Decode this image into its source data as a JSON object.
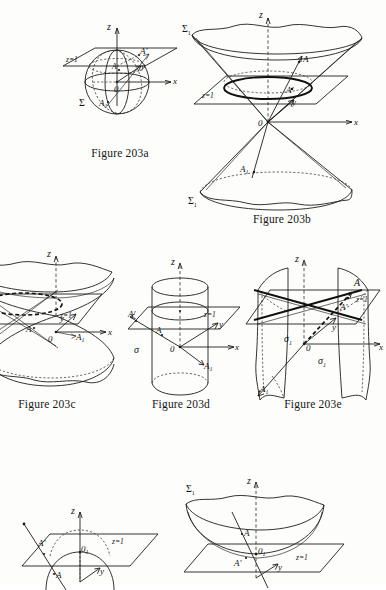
{
  "page": {
    "background_color": "#fdfdfc",
    "ink_color": "#1d1d1a",
    "width": 386,
    "height": 584
  },
  "figures": [
    {
      "id": "203a",
      "caption": "Figure 203a",
      "surface": "sphere",
      "labels": {
        "z_axis": "z",
        "x_axis": "x",
        "y_axis": "y",
        "origin": "0",
        "plane": "z=1",
        "sigma": "Σ",
        "point_a": "A",
        "point_a_prime": "A'",
        "point_a_one": "A",
        "point_a_one_sub": "1"
      }
    },
    {
      "id": "203b",
      "caption": "Figure 203b",
      "surface": "double-cone",
      "labels": {
        "z_axis": "z",
        "x_axis": "x",
        "y_axis": "y",
        "origin": "0",
        "plane": "z=1",
        "sigma_top": "Σ",
        "sigma_top_sub": "1",
        "sigma_bottom": "Σ",
        "sigma_bottom_sub": "1",
        "point_a": "A",
        "point_a_prime": "A'",
        "point_a_one": "A",
        "point_a_one_sub": "1"
      }
    },
    {
      "id": "203c",
      "caption": "Figure 203c",
      "surface": "hyperboloid-one-sheet",
      "labels": {
        "z_axis": "z",
        "x_axis": "x",
        "y_axis": "y",
        "origin": "0",
        "plane": "z=1",
        "point_a": "A",
        "point_a_one": "A",
        "point_a_one_sub": "1"
      }
    },
    {
      "id": "203d",
      "caption": "Figure 203d",
      "surface": "cylinder",
      "labels": {
        "z_axis": "z",
        "x_axis": "x",
        "y_axis": "y",
        "origin": "0",
        "plane": "z=1",
        "sigma": "σ",
        "point_a": "A",
        "point_a_prime": "A'",
        "point_a_one": "A",
        "point_a_one_sub": "1"
      }
    },
    {
      "id": "203e",
      "caption": "Figure 203e",
      "surface": "hyperbolic-cylinder-pair",
      "labels": {
        "z_axis": "z",
        "x_axis": "x",
        "y_axis": "y",
        "origin": "0",
        "plane": "z=1",
        "sigma": "σ",
        "sigma_sub": "1",
        "sigma_two": "σ",
        "sigma_two_sub": "1",
        "point_a": "A",
        "point_a_prime": "A'",
        "point_a_one": "A",
        "point_a_one_sub": "1"
      }
    },
    {
      "id": "203f",
      "caption": "",
      "surface": "plane-with-circle",
      "labels": {
        "z_axis": "z",
        "y_axis": "y",
        "plane": "z=1",
        "origin": "0",
        "origin_sub": "1",
        "point_a": "A",
        "point_a_prime": "A'"
      }
    },
    {
      "id": "203g",
      "caption": "",
      "surface": "elliptic-paraboloid",
      "labels": {
        "z_axis": "z",
        "y_axis": "y",
        "plane": "z=1",
        "origin": "0",
        "origin_sub": "1",
        "sigma": "Σ",
        "sigma_sub": "1",
        "point_a": "A",
        "point_a_prime": "A'"
      }
    }
  ]
}
